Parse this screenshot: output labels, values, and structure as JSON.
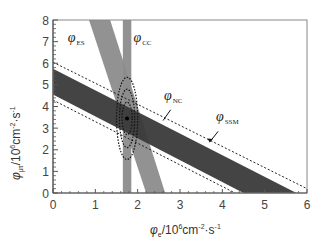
{
  "chart_data": {
    "type": "band-constraint",
    "title": "",
    "xlabel": "φe / 10^6 cm^-2·s^-1",
    "ylabel": "φμτ / 10^6 cm^-2·s^-1",
    "xlim": [
      0,
      6
    ],
    "ylim": [
      0,
      8
    ],
    "x_ticks": [
      "0",
      "1",
      "2",
      "3",
      "4",
      "5",
      "6"
    ],
    "y_ticks": [
      "0",
      "1",
      "2",
      "3",
      "4",
      "5",
      "6",
      "7",
      "8"
    ],
    "grid": false,
    "bands": [
      {
        "name": "φCC",
        "color": "#8c8c8c",
        "shape": "vertical",
        "x_range": [
          1.65,
          1.85
        ]
      },
      {
        "name": "φES",
        "color": "#8c8c8c",
        "shape": "diagonal",
        "top_x_at_y8": [
          0.85,
          1.35
        ],
        "bottom_x_at_y0": [
          2.2,
          2.65
        ]
      },
      {
        "name": "φNC",
        "color": "#3a3a3a",
        "shape": "diagonal",
        "upper_line": {
          "y_at_x0": 5.75,
          "x_at_y0": 5.75
        },
        "lower_line": {
          "y_at_x0": 4.55,
          "x_at_y0": 4.5
        }
      }
    ],
    "lines": [
      {
        "name": "φSSM upper",
        "style": "dashed",
        "points": [
          [
            0,
            6.05
          ],
          [
            6,
            0.2
          ]
        ]
      },
      {
        "name": "φSSM lower",
        "style": "dashed",
        "points": [
          [
            0,
            4.3
          ],
          [
            4.3,
            0
          ]
        ]
      }
    ],
    "best_fit_point": [
      1.75,
      3.45
    ],
    "contours": [
      {
        "level": "68%",
        "cx": 1.75,
        "cy": 3.45,
        "rx": 0.12,
        "ry": 0.75
      },
      {
        "level": "95%",
        "cx": 1.75,
        "cy": 3.45,
        "rx": 0.18,
        "ry": 1.35
      },
      {
        "level": "99%",
        "cx": 1.75,
        "cy": 3.45,
        "rx": 0.25,
        "ry": 1.9
      }
    ],
    "annotations": [
      {
        "text": "φES",
        "x": 0.35,
        "y": 7.1
      },
      {
        "text": "φCC",
        "x": 1.85,
        "y": 7.1
      },
      {
        "text": "φNC",
        "x": 2.6,
        "y": 4.3
      },
      {
        "text": "φSSM",
        "x": 3.8,
        "y": 3.3
      }
    ]
  },
  "labels": {
    "phi": "φ",
    "es": "ES",
    "cc": "CC",
    "nc": "NC",
    "ssm": "SSM",
    "x_axis_sub": "e",
    "y_axis_sub": "μτ",
    "unit_prefix": "/10",
    "unit_exp": "6",
    "unit_cm": "cm",
    "unit_cm_exp": "-2",
    "unit_dot_s": "·s",
    "unit_s_exp": "-1"
  }
}
